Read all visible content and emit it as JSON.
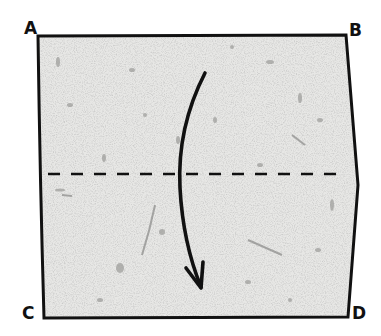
{
  "diagram": {
    "type": "origami-fold-step",
    "paper": {
      "shape": "square",
      "fill": "#e6e6e4",
      "outline": "#111111",
      "texture": "speckled"
    },
    "corners": [
      {
        "id": "A",
        "label": "A",
        "position": "top-left"
      },
      {
        "id": "B",
        "label": "B",
        "position": "top-right"
      },
      {
        "id": "C",
        "label": "C",
        "position": "bottom-left"
      },
      {
        "id": "D",
        "label": "D",
        "position": "bottom-right"
      }
    ],
    "fold_line": {
      "style": "dashed",
      "orientation": "horizontal",
      "location": "middle"
    },
    "arrow": {
      "direction": "down",
      "style": "curved",
      "meaning": "fold top edge down"
    }
  }
}
